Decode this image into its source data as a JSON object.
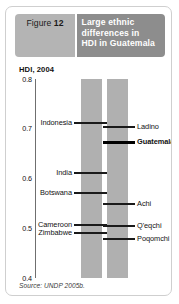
{
  "header": {
    "figure_prefix": "Figure",
    "figure_number": "12",
    "title_lines": [
      "Large ethnic",
      "differences in",
      "HDI in Guatemala"
    ],
    "title_full": "Large ethnic differences in HDI in Guatemala",
    "number_box_color": "#b4b4b4",
    "title_box_color": "#8d8d8d",
    "title_text_color": "#ffffff"
  },
  "source": "Source: UNDP 2005b.",
  "chart_data": {
    "type": "scatter",
    "subtitle": "",
    "xlabel": "",
    "ylabel": "HDI, 2004",
    "axis_title": "HDI, 2004",
    "ylim": [
      0.4,
      0.8
    ],
    "ytick_labels": [
      "0.8",
      "0.7",
      "0.6",
      "0.5",
      "0.4"
    ],
    "ytick_values": [
      0.8,
      0.7,
      0.6,
      0.5,
      0.4
    ],
    "grid": false,
    "legend": "none",
    "bar_color": "#b0b0b0",
    "mark_color": "#1a1a1a",
    "series": [
      {
        "name": "Comparator countries",
        "column": "left",
        "label_side": "left",
        "points": [
          {
            "label": "Indonesia",
            "value": 0.711,
            "emphasis": false
          },
          {
            "label": "India",
            "value": 0.611,
            "emphasis": false
          },
          {
            "label": "Botswana",
            "value": 0.57,
            "emphasis": false
          },
          {
            "label": "Cameroon",
            "value": 0.506,
            "emphasis": false
          },
          {
            "label": "Zimbabwe",
            "value": 0.491,
            "emphasis": false
          }
        ]
      },
      {
        "name": "Guatemala and ethnic groups",
        "column": "right",
        "label_side": "right",
        "points": [
          {
            "label": "Ladino",
            "value": 0.703,
            "emphasis": false
          },
          {
            "label": "Guatemala",
            "value": 0.673,
            "emphasis": true
          },
          {
            "label": "Achi",
            "value": 0.548,
            "emphasis": false
          },
          {
            "label": "Q'eqchi",
            "value": 0.505,
            "emphasis": false
          },
          {
            "label": "Poqomchi",
            "value": 0.478,
            "emphasis": false
          }
        ]
      }
    ]
  }
}
